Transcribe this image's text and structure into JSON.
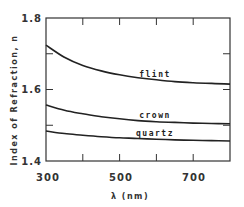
{
  "chart_data": {
    "type": "line",
    "title": "",
    "xlabel": "λ (nm)",
    "ylabel": "Index of Refraction, n",
    "xlim": [
      300,
      800
    ],
    "ylim": [
      1.4,
      1.8
    ],
    "x_ticks": [
      300,
      400,
      500,
      600,
      700,
      800
    ],
    "x_tick_labels": [
      "300",
      "",
      "500",
      "",
      "700",
      ""
    ],
    "y_ticks": [
      1.4,
      1.5,
      1.6,
      1.7,
      1.8
    ],
    "y_tick_labels": [
      "1.4",
      "",
      "1.6",
      "",
      "1.8"
    ],
    "grid": false,
    "legend": "inline labels",
    "x": [
      300,
      350,
      400,
      450,
      500,
      550,
      600,
      650,
      700,
      750,
      800
    ],
    "series": [
      {
        "name": "flint",
        "values": [
          1.724,
          1.69,
          1.667,
          1.652,
          1.641,
          1.633,
          1.627,
          1.622,
          1.619,
          1.617,
          1.615
        ]
      },
      {
        "name": "crown",
        "values": [
          1.557,
          1.542,
          1.532,
          1.524,
          1.518,
          1.513,
          1.51,
          1.508,
          1.506,
          1.505,
          1.504
        ]
      },
      {
        "name": "quartz",
        "values": [
          1.484,
          1.477,
          1.472,
          1.468,
          1.465,
          1.463,
          1.461,
          1.459,
          1.458,
          1.457,
          1.456
        ]
      }
    ],
    "annotations": [
      {
        "text": "flint",
        "x": 610,
        "y": 1.64
      },
      {
        "text": "crown",
        "x": 610,
        "y": 1.52
      },
      {
        "text": "quartz",
        "x": 610,
        "y": 1.475
      }
    ]
  },
  "labels": {
    "xlabel": "λ (nm)",
    "ylabel": "Index of Refraction, n",
    "x_ticks": [
      "300",
      "500",
      "700"
    ],
    "y_ticks": [
      "1.8",
      "1.6",
      "1.4"
    ],
    "curves": [
      "flint",
      "crown",
      "quartz"
    ]
  }
}
